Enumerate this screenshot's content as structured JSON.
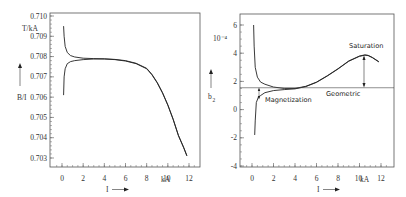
{
  "chart_data": [
    {
      "type": "line",
      "title": "",
      "xlabel": "I",
      "ylabel": "B/I",
      "y_unit": "T/kA",
      "x_unit": "kA",
      "xlim": [
        -1,
        13
      ],
      "ylim": [
        0.7026,
        0.7101
      ],
      "x_ticks": [
        "0",
        "2",
        "4",
        "6",
        "8",
        "10",
        "12"
      ],
      "y_ticks": [
        "0.710",
        "0.709",
        "0.708",
        "0.707",
        "0.706",
        "0.705",
        "0.704",
        "0.703"
      ],
      "grid": false,
      "legend": null,
      "series": [
        {
          "name": "B/I ramp up",
          "x": [
            0.15,
            0.2,
            0.3,
            0.5,
            0.8,
            1.2,
            2,
            3,
            4,
            5,
            6,
            7,
            8,
            8.5,
            9,
            9.5,
            10,
            10.5,
            11,
            11.5,
            11.8
          ],
          "y": [
            0.7061,
            0.707,
            0.7074,
            0.70765,
            0.70775,
            0.7078,
            0.70785,
            0.70788,
            0.70788,
            0.70785,
            0.70778,
            0.70765,
            0.7074,
            0.7071,
            0.7067,
            0.7062,
            0.7056,
            0.7049,
            0.7041,
            0.7035,
            0.7031
          ]
        },
        {
          "name": "B/I ramp down",
          "x": [
            0.15,
            0.2,
            0.3,
            0.5,
            0.8,
            1.2,
            2,
            3,
            4,
            5,
            6,
            7,
            8,
            8.5,
            9,
            9.5,
            10,
            10.5,
            11,
            11.5,
            11.8
          ],
          "y": [
            0.7095,
            0.709,
            0.7085,
            0.7082,
            0.70805,
            0.70798,
            0.70792,
            0.7079,
            0.70789,
            0.70786,
            0.7078,
            0.70767,
            0.70742,
            0.70712,
            0.70672,
            0.70622,
            0.70562,
            0.70492,
            0.70412,
            0.70352,
            0.70312
          ]
        }
      ]
    },
    {
      "type": "line",
      "title": "",
      "xlabel": "I",
      "ylabel": "b2",
      "y_unit": "10^-4",
      "x_unit": "kA",
      "xlim": [
        -1,
        13
      ],
      "ylim": [
        -4.1,
        7.0
      ],
      "x_ticks": [
        "0",
        "2",
        "4",
        "6",
        "8",
        "10",
        "12"
      ],
      "y_ticks": [
        "6",
        "4",
        "2",
        "0",
        "-2",
        "-4"
      ],
      "grid": false,
      "legend": null,
      "annotations": [
        "Saturation",
        "Geometric",
        "Magnetization"
      ],
      "series": [
        {
          "name": "b2 ramp down",
          "x": [
            0.15,
            0.2,
            0.3,
            0.5,
            0.8,
            1.2,
            2,
            3,
            4,
            5,
            6,
            7,
            8,
            9,
            10,
            10.5,
            10.8,
            11.2,
            11.8
          ],
          "y": [
            6.0,
            4.5,
            3.0,
            2.3,
            1.95,
            1.8,
            1.6,
            1.5,
            1.5,
            1.65,
            1.95,
            2.4,
            2.9,
            3.45,
            3.8,
            3.88,
            3.85,
            3.7,
            3.4
          ]
        },
        {
          "name": "b2 ramp up",
          "x": [
            0.25,
            0.3,
            0.4,
            0.6,
            0.8,
            1.2,
            2,
            3,
            4,
            5,
            6,
            7,
            8,
            9,
            10,
            10.5,
            10.8,
            11.2,
            11.8
          ],
          "y": [
            -1.8,
            -0.8,
            0.5,
            0.9,
            1.0,
            1.2,
            1.35,
            1.42,
            1.47,
            1.63,
            1.93,
            2.38,
            2.88,
            3.43,
            3.78,
            3.86,
            3.83,
            3.68,
            3.38
          ]
        },
        {
          "name": "Geometric",
          "x": [
            -1,
            13
          ],
          "y": [
            1.55,
            1.55
          ]
        }
      ]
    }
  ],
  "left_chart": {
    "y_unit_label": "T/kA",
    "y_axis_label": "B/I",
    "x_axis_label": "I",
    "x_unit_label": "kA",
    "x_ticks": [
      "0",
      "2",
      "4",
      "6",
      "8",
      "10",
      "12"
    ],
    "y_ticks": [
      "0.710",
      "0.709",
      "0.708",
      "0.707",
      "0.706",
      "0.705",
      "0.704",
      "0.703"
    ]
  },
  "right_chart": {
    "y_unit_label": "10⁻⁴",
    "y_axis_label": "b",
    "y_axis_subscript": "2",
    "x_axis_label": "I",
    "x_unit_label": "kA",
    "x_ticks": [
      "0",
      "2",
      "4",
      "6",
      "8",
      "10",
      "12"
    ],
    "y_ticks": [
      "6",
      "4",
      "2",
      "0",
      "-2",
      "-4"
    ],
    "annotations": {
      "saturation": "Saturation",
      "geometric": "Geometric",
      "magnetization": "Magnetization"
    }
  }
}
